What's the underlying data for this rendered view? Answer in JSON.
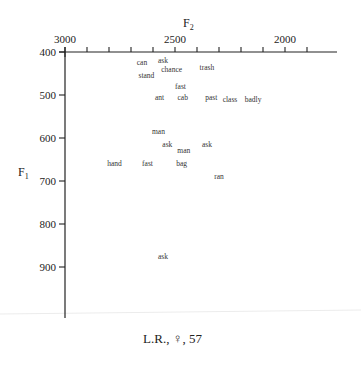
{
  "chart_data": {
    "type": "scatter",
    "title": "",
    "caption": "L.R., ♀, 57",
    "xlabel": "F2",
    "ylabel": "F1",
    "x_axis": {
      "position": "top",
      "reversed": true,
      "range": [
        3000,
        1900
      ],
      "tick_step": 100,
      "labeled_ticks": [
        3000,
        2500,
        2000
      ]
    },
    "y_axis": {
      "position": "left",
      "reversed": true,
      "range": [
        400,
        1000
      ],
      "tick_step": 100,
      "labeled_ticks": [
        400,
        500,
        600,
        700,
        800,
        900
      ]
    },
    "grid": false,
    "legend": null,
    "points": [
      {
        "label": "can",
        "F2": 2650,
        "F1": 425
      },
      {
        "label": "ask",
        "F2": 2555,
        "F1": 420
      },
      {
        "label": "chance",
        "F2": 2515,
        "F1": 440
      },
      {
        "label": "stand",
        "F2": 2630,
        "F1": 455
      },
      {
        "label": "trash",
        "F2": 2355,
        "F1": 435
      },
      {
        "label": "fast",
        "F2": 2475,
        "F1": 480
      },
      {
        "label": "ant",
        "F2": 2570,
        "F1": 505
      },
      {
        "label": "cab",
        "F2": 2465,
        "F1": 505
      },
      {
        "label": "past",
        "F2": 2335,
        "F1": 505
      },
      {
        "label": "class",
        "F2": 2250,
        "F1": 510
      },
      {
        "label": "badly",
        "F2": 2145,
        "F1": 510
      },
      {
        "label": "man",
        "F2": 2575,
        "F1": 585
      },
      {
        "label": "ask",
        "F2": 2535,
        "F1": 615
      },
      {
        "label": "man",
        "F2": 2460,
        "F1": 630
      },
      {
        "label": "ask",
        "F2": 2355,
        "F1": 615
      },
      {
        "label": "hand",
        "F2": 2775,
        "F1": 660
      },
      {
        "label": "fast",
        "F2": 2625,
        "F1": 660
      },
      {
        "label": "bag",
        "F2": 2470,
        "F1": 660
      },
      {
        "label": "ran",
        "F2": 2300,
        "F1": 690
      },
      {
        "label": "ask",
        "F2": 2555,
        "F1": 875
      }
    ]
  },
  "labels": {
    "x_title": "F",
    "x_sub": "2",
    "y_title": "F",
    "y_sub": "1",
    "caption": "L.R., ♀, 57"
  }
}
